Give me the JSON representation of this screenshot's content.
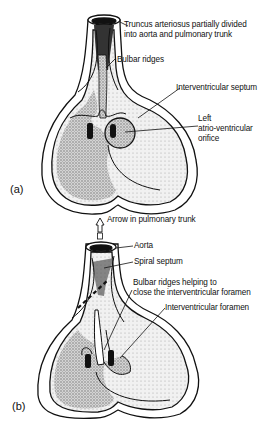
{
  "figure": {
    "panel_a": {
      "tag": "(a)",
      "labels": {
        "truncus_line1": "Truncus arteriosus partially divided",
        "truncus_line2": "into aorta and pulmonary trunk",
        "bulbar_ridges": "Bulbar ridges",
        "interventricular_septum": "Interventricular septum",
        "left_av_line1": "Left",
        "left_av_line2": "atrio-ventricular",
        "left_av_line3": "orifice"
      }
    },
    "panel_b": {
      "tag": "(b)",
      "labels": {
        "arrow_pulmonary": "Arrow in pulmonary trunk",
        "aorta": "Aorta",
        "spiral_septum": "Spiral septum",
        "bulbar_line1": "Bulbar ridges helping to",
        "bulbar_line2": "close the interventricular foramen",
        "interventricular_foramen": "Interventricular foramen"
      }
    },
    "colors": {
      "ink": "#111111",
      "shade": "#b8b8b8",
      "background": "#ffffff"
    }
  }
}
